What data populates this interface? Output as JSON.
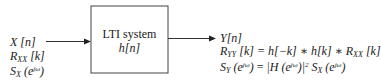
{
  "block": {
    "title": "LTI system",
    "impulse_response": "h[n]"
  },
  "input": {
    "signal": {
      "base": "X",
      "arg": "[n]"
    },
    "autocorrelation": {
      "base": "R",
      "sub": "XX",
      "arg": "[k]"
    },
    "psd": {
      "base": "S",
      "sub": "X",
      "arg_open": "(e",
      "sup": "jω",
      "arg_close": ")"
    }
  },
  "output": {
    "signal": {
      "base": "Y",
      "arg": "[n]"
    },
    "autocorrelation": {
      "lhs_base": "R",
      "lhs_sub": "YY",
      "lhs_arg": "[k]",
      "rhs_a": " = h[−k] ∗ h[k] ∗ ",
      "rhs_base": "R",
      "rhs_sub": "XX",
      "rhs_arg": " [k]"
    },
    "psd": {
      "lhs_base": "S",
      "lhs_sub": "Y",
      "lhs_arg_open": " (e",
      "lhs_sup": "jω",
      "lhs_arg_close": ")",
      "eq": " = ",
      "abs_open": "|H (e",
      "abs_sup": "jω",
      "abs_close": ")|",
      "square": "2",
      "rhs_base": " S",
      "rhs_sub": "X",
      "rhs_arg_open": " (e",
      "rhs_sup": "jω",
      "rhs_arg_close": ")"
    }
  },
  "colors": {
    "stroke": "#333333",
    "text": "#1a1a1a"
  }
}
